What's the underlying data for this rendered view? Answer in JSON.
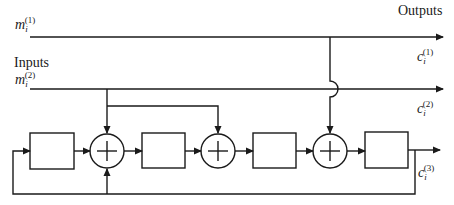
{
  "labels": {
    "inputs": "Inputs",
    "outputs": "Outputs"
  },
  "signals": {
    "m1": {
      "base": "m",
      "sub": "i",
      "sup": "(1)"
    },
    "m2": {
      "base": "m",
      "sub": "i",
      "sup": "(2)"
    },
    "c1": {
      "base": "c",
      "sub": "i",
      "sup": "(1)"
    },
    "c2": {
      "base": "c",
      "sub": "i",
      "sup": "(2)"
    },
    "c3": {
      "base": "c",
      "sub": "i",
      "sup": "(3)"
    }
  },
  "blocks": [
    {
      "id": "delay-1",
      "type": "shift-register-stage",
      "label": ""
    },
    {
      "id": "delay-2",
      "type": "shift-register-stage",
      "label": ""
    },
    {
      "id": "delay-3",
      "type": "shift-register-stage",
      "label": ""
    },
    {
      "id": "delay-4",
      "type": "shift-register-stage",
      "label": ""
    }
  ],
  "adders": [
    {
      "id": "adder-1",
      "symbol": "+"
    },
    {
      "id": "adder-2",
      "symbol": "+"
    },
    {
      "id": "adder-3",
      "symbol": "+"
    }
  ],
  "colors": {
    "stroke": "#1a1a1a",
    "background": "#ffffff"
  }
}
